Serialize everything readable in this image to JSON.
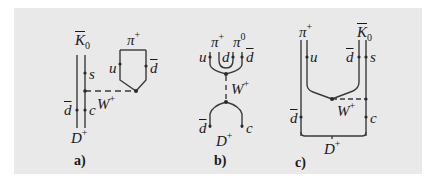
{
  "figure": {
    "background": "#e9e9e9",
    "line_color": "#3a3a3a",
    "panels": [
      {
        "id": "a",
        "caption": "a)",
        "labels": {
          "kaon": "K",
          "kaon_sub": "0",
          "pion": "π",
          "pion_sup": "+",
          "s_quark": "s",
          "u_quark": "u",
          "dbar_right": "d",
          "w_boson": "W",
          "w_sup": "+",
          "dbar_left": "d",
          "c_quark": "c",
          "d_meson": "D",
          "d_meson_sup": "+"
        }
      },
      {
        "id": "b",
        "caption": "b)",
        "labels": {
          "pion_plus": "π",
          "pion_plus_sup": "+",
          "pion_zero": "π",
          "pion_zero_sup": "0",
          "u_quark": "u",
          "d_quark": "d",
          "dbar_quark": "d",
          "w_boson": "W",
          "w_sup": "+",
          "dbar_lower": "d",
          "c_quark": "c",
          "d_meson": "D",
          "d_meson_sup": "+"
        }
      },
      {
        "id": "c",
        "caption": "c)",
        "labels": {
          "pion": "π",
          "pion_sup": "+",
          "kaon": "K",
          "kaon_sub": "0",
          "u_quark": "u",
          "dbar_upper": "d",
          "s_quark": "s",
          "w_boson": "W",
          "w_sup": "+",
          "dbar_lower": "d",
          "c_quark": "c",
          "d_meson": "D",
          "d_meson_sup": "+"
        }
      }
    ]
  }
}
